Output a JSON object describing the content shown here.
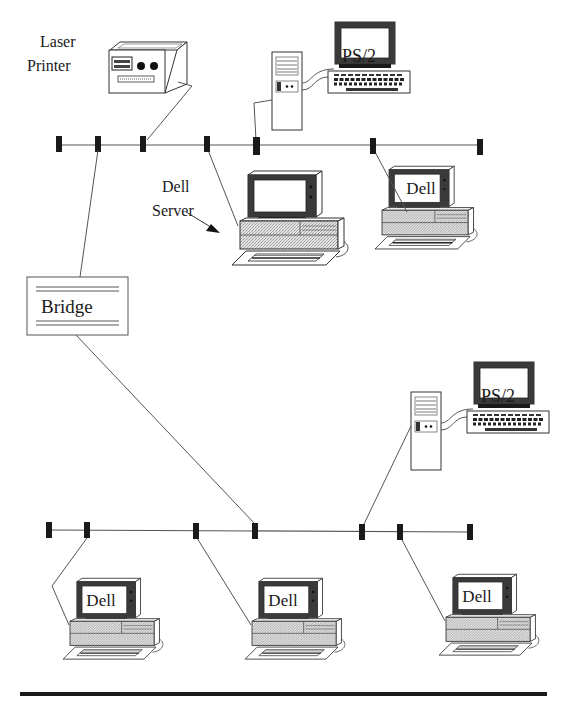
{
  "diagram": {
    "labels": {
      "laser_printer_line1": "Laser",
      "laser_printer_line2": "Printer",
      "dell_server_line1": "Dell",
      "dell_server_line2": "Server",
      "bridge": "Bridge",
      "ps2_top": "PS/2",
      "ps2_bottom": "PS/2",
      "dell_top_right": "Dell",
      "dell_bottom_1": "Dell",
      "dell_bottom_2": "Dell",
      "dell_bottom_3": "Dell"
    },
    "segments": [
      {
        "name": "upper-segment",
        "bus_y": 145,
        "x_start": 59,
        "x_end": 480,
        "connectors_x": [
          59,
          98,
          143,
          207,
          256,
          373,
          480
        ]
      },
      {
        "name": "lower-segment",
        "bus_y": 530,
        "x_start": 49,
        "x_end": 470,
        "connectors_x": [
          49,
          87,
          196,
          255,
          362,
          400,
          470
        ]
      }
    ],
    "nodes": [
      {
        "id": "laser-printer",
        "type": "printer",
        "segment": "upper",
        "connector_x": 143
      },
      {
        "id": "ps2-upper",
        "type": "ps2-workstation",
        "segment": "upper",
        "connector_x": 256
      },
      {
        "id": "dell-server",
        "type": "dell-pc",
        "segment": "upper",
        "connector_x": 207
      },
      {
        "id": "dell-upper-right",
        "type": "dell-pc",
        "segment": "upper",
        "connector_x": 373
      },
      {
        "id": "bridge",
        "type": "bridge",
        "segment": "both",
        "connector_x_upper": 98,
        "connector_x_lower": 255
      },
      {
        "id": "ps2-lower",
        "type": "ps2-workstation",
        "segment": "lower",
        "connector_x": 362
      },
      {
        "id": "dell-lower-1",
        "type": "dell-pc",
        "segment": "lower",
        "connector_x": 87
      },
      {
        "id": "dell-lower-2",
        "type": "dell-pc",
        "segment": "lower",
        "connector_x": 196
      },
      {
        "id": "dell-lower-3",
        "type": "dell-pc",
        "segment": "lower",
        "connector_x": 400
      }
    ],
    "colors": {
      "ink": "#1a1a1a",
      "screen_bezel": "#3a3a3a",
      "case_fill": "#d4d4d4",
      "paper": "#ffffff"
    }
  }
}
